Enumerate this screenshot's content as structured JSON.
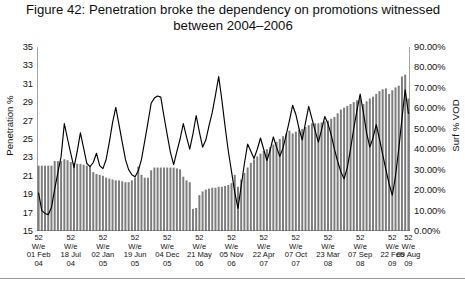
{
  "figure": {
    "title": "Figure 42: Penetration broke the dependency on promotions witnessed between 2004–2006"
  },
  "axes": {
    "left_title": "Penetration %",
    "right_title": "Surf % VOD",
    "left_ticks": [
      "15",
      "17",
      "19",
      "21",
      "23",
      "25",
      "27",
      "29",
      "31",
      "33",
      "35"
    ],
    "right_ticks": [
      "0.00%",
      "10.00%",
      "20.00%",
      "30.00%",
      "40.00%",
      "50.00%",
      "60.00%",
      "70.00%",
      "80.00%",
      "90.00%"
    ]
  },
  "chart_data": {
    "type": "bar",
    "title": "Figure 42: Penetration broke the dependency on promotions witnessed between 2004–2006",
    "xlabel": "",
    "ylabel": "Penetration %",
    "y2label": "Surf % VOD",
    "ylim": [
      15,
      35
    ],
    "y2lim": [
      0,
      90
    ],
    "grid": false,
    "legend": "none",
    "x_tick_labels": [
      "52 W/e 01 Feb 04",
      "52 W/e 18 Jul 04",
      "52 W/e 02 Jan 05",
      "52 W/e 19 Jun 05",
      "52 W/e 04 Dec 05",
      "52 W/e 21 May 06",
      "52 W/e 05 Nov 06",
      "52 W/e 22 Apr 07",
      "52 W/e 07 Oct 07",
      "52 W/e 23 Mar 08",
      "52 W/e 07 Sep 08",
      "52 W/e 22 Feb 09",
      "52 W/e 09 Aug 09"
    ],
    "x_tick_indices": [
      0,
      10,
      20,
      30,
      40,
      50,
      60,
      70,
      80,
      90,
      100,
      110,
      115
    ],
    "series": [
      {
        "name": "Penetration %",
        "render": "bar",
        "axis": "left",
        "color": "#7d7d7d",
        "values": [
          22.1,
          22.1,
          22.1,
          22.1,
          22.1,
          22.6,
          22.6,
          22.6,
          22.8,
          22.7,
          22.5,
          22.4,
          22.3,
          22.3,
          22.2,
          22.1,
          22.0,
          21.4,
          21.2,
          21.1,
          21.0,
          20.8,
          20.7,
          20.6,
          20.5,
          20.5,
          20.4,
          20.3,
          20.3,
          20.5,
          20.8,
          22.0,
          21.1,
          20.8,
          20.8,
          21.6,
          21.9,
          21.9,
          21.9,
          21.9,
          21.9,
          21.9,
          21.9,
          21.8,
          21.7,
          20.9,
          20.5,
          20.3,
          17.4,
          17.5,
          18.9,
          19.3,
          19.5,
          19.6,
          19.7,
          19.7,
          19.8,
          19.8,
          19.9,
          20.0,
          20.2,
          21.1,
          19.8,
          20.6,
          21.3,
          21.9,
          22.4,
          22.8,
          23.1,
          23.4,
          23.7,
          23.9,
          24.1,
          24.4,
          24.7,
          25.0,
          25.3,
          25.6,
          25.9,
          25.6,
          25.8,
          26.0,
          26.1,
          26.3,
          26.5,
          26.7,
          26.7,
          26.7,
          26.8,
          26.9,
          27.0,
          27.2,
          27.4,
          27.8,
          28.2,
          28.4,
          28.6,
          28.8,
          29.0,
          29.2,
          29.4,
          28.8,
          29.1,
          29.4,
          29.6,
          29.9,
          30.2,
          30.4,
          30.5,
          29.9,
          30.3,
          30.6,
          30.8,
          31.8,
          32.0,
          29.4
        ]
      },
      {
        "name": "Surf % VOD",
        "render": "line",
        "axis": "right",
        "color": "#000000",
        "values": [
          18.5,
          10.0,
          8.6,
          8.0,
          11.5,
          20.5,
          28.5,
          36.5,
          52.5,
          45.0,
          38.0,
          31.0,
          39.0,
          48.0,
          40.5,
          33.0,
          31.5,
          33.5,
          38.0,
          32.0,
          30.5,
          35.0,
          43.5,
          53.0,
          60.5,
          52.0,
          43.5,
          35.0,
          30.0,
          27.5,
          26.5,
          29.5,
          35.0,
          44.0,
          53.0,
          62.5,
          65.0,
          66.0,
          65.5,
          56.0,
          47.0,
          38.5,
          32.5,
          39.0,
          45.0,
          52.5,
          46.0,
          40.0,
          47.5,
          56.5,
          48.5,
          41.0,
          44.5,
          51.5,
          58.0,
          66.5,
          75.5,
          64.0,
          51.0,
          39.0,
          29.0,
          19.0,
          11.0,
          22.0,
          33.0,
          42.5,
          39.0,
          35.5,
          40.0,
          45.5,
          40.0,
          34.5,
          39.5,
          46.0,
          41.0,
          36.5,
          40.5,
          47.0,
          54.0,
          61.5,
          57.0,
          50.0,
          44.5,
          53.0,
          61.0,
          55.0,
          49.0,
          43.5,
          49.5,
          56.0,
          52.5,
          47.0,
          40.0,
          34.0,
          29.0,
          25.5,
          31.0,
          40.0,
          50.0,
          59.0,
          67.0,
          58.0,
          48.0,
          41.0,
          45.5,
          52.0,
          45.0,
          37.5,
          30.0,
          23.0,
          17.5,
          27.0,
          40.0,
          55.0,
          69.0,
          57.5
        ]
      }
    ]
  }
}
